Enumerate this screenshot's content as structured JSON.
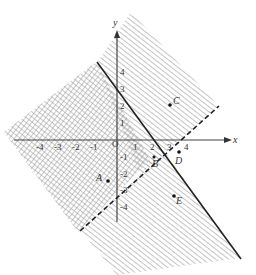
{
  "diagram": {
    "type": "linear-inequality-graph",
    "axes": {
      "x_label": "x",
      "y_label": "y",
      "origin_label": "O",
      "x_ticks": [
        "-4",
        "-3",
        "-2",
        "-1",
        "1",
        "2",
        "3",
        "4"
      ],
      "y_ticks": [
        "4",
        "3",
        "2",
        "1",
        "-1",
        "-2",
        "-3",
        "-4"
      ]
    },
    "lines": [
      {
        "name": "solid-boundary",
        "style": "solid",
        "passes_through": [
          [
            0,
            3
          ],
          [
            2.4,
            0
          ]
        ]
      },
      {
        "name": "dashed-boundary",
        "style": "dashed",
        "passes_through": [
          [
            3,
            0
          ],
          [
            0,
            -3
          ]
        ]
      }
    ],
    "regions": [
      {
        "name": "diagonal-hatched-region",
        "fill": "diagonal lines"
      },
      {
        "name": "cross-hatched-region",
        "fill": "grid cross-hatch"
      }
    ],
    "points": [
      {
        "label": "A",
        "x": -1,
        "y": -2
      },
      {
        "label": "B",
        "x": 2,
        "y": -1
      },
      {
        "label": "C",
        "x": 3,
        "y": 3
      },
      {
        "label": "D",
        "x": 3.5,
        "y": -0.5
      },
      {
        "label": "E",
        "x": 3.5,
        "y": -3.5
      }
    ]
  }
}
